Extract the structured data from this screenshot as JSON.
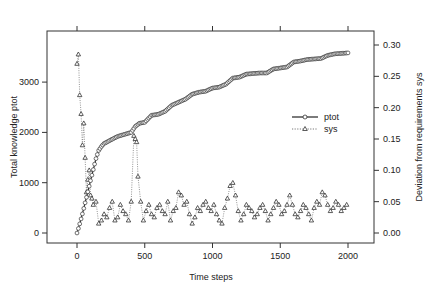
{
  "chart_data": {
    "type": "line",
    "title": "",
    "xlabel": "Time steps",
    "ylabel": "Total knowledge ptot",
    "y2label": "Deviation from requirements sys",
    "xlim": [
      -220,
      2220
    ],
    "ylim": [
      -400,
      3900
    ],
    "y2lim": [
      -0.032,
      0.33
    ],
    "x_ticks": [
      0,
      500,
      1000,
      1500,
      2000
    ],
    "y_ticks": [
      0,
      1000,
      2000,
      3000
    ],
    "y2_ticks": [
      "0.00",
      "0.05",
      "0.10",
      "0.15",
      "0.20",
      "0.25",
      "0.30"
    ],
    "grid": false,
    "legend": {
      "position": "center-right",
      "entries": [
        "ptot",
        "sys"
      ]
    },
    "series": [
      {
        "name": "ptot",
        "axis": "left",
        "style": "solid line with open circles",
        "x": [
          0,
          20,
          40,
          60,
          80,
          100,
          120,
          140,
          160,
          180,
          200,
          250,
          300,
          350,
          400,
          430,
          460,
          500,
          550,
          600,
          650,
          700,
          750,
          800,
          850,
          900,
          950,
          1000,
          1050,
          1100,
          1150,
          1200,
          1250,
          1300,
          1350,
          1400,
          1450,
          1500,
          1550,
          1600,
          1650,
          1700,
          1750,
          1800,
          1850,
          1900,
          1950,
          2000
        ],
        "values": [
          0,
          180,
          380,
          600,
          820,
          1040,
          1260,
          1480,
          1640,
          1720,
          1780,
          1850,
          1920,
          1960,
          2000,
          2120,
          2180,
          2200,
          2340,
          2360,
          2420,
          2540,
          2600,
          2660,
          2760,
          2800,
          2820,
          2880,
          2900,
          2960,
          3080,
          3100,
          3160,
          3170,
          3180,
          3180,
          3260,
          3280,
          3300,
          3400,
          3420,
          3450,
          3460,
          3470,
          3530,
          3560,
          3570,
          3580
        ]
      },
      {
        "name": "sys",
        "axis": "right",
        "style": "dotted line with open triangles",
        "x": [
          0,
          10,
          20,
          30,
          40,
          50,
          60,
          70,
          80,
          90,
          100,
          110,
          120,
          140,
          160,
          180,
          200,
          220,
          240,
          260,
          280,
          300,
          320,
          340,
          360,
          380,
          400,
          420,
          430,
          440,
          450,
          470,
          490,
          510,
          530,
          550,
          570,
          590,
          610,
          630,
          650,
          670,
          690,
          710,
          730,
          750,
          770,
          790,
          810,
          830,
          850,
          870,
          890,
          910,
          930,
          950,
          970,
          990,
          1010,
          1030,
          1050,
          1070,
          1090,
          1110,
          1130,
          1150,
          1170,
          1190,
          1210,
          1230,
          1250,
          1270,
          1290,
          1310,
          1330,
          1350,
          1370,
          1390,
          1410,
          1430,
          1450,
          1470,
          1490,
          1510,
          1530,
          1550,
          1570,
          1590,
          1610,
          1630,
          1650,
          1670,
          1690,
          1710,
          1730,
          1750,
          1770,
          1790,
          1810,
          1830,
          1850,
          1870,
          1890,
          1910,
          1930,
          1950,
          1970,
          1990
        ],
        "values": [
          0.27,
          0.285,
          0.22,
          0.19,
          0.14,
          0.175,
          0.12,
          0.065,
          0.085,
          0.1,
          0.06,
          0.055,
          0.045,
          0.05,
          0.015,
          0.02,
          0.03,
          0.025,
          0.04,
          0.05,
          0.02,
          0.025,
          0.045,
          0.035,
          0.03,
          0.02,
          0.05,
          0.155,
          0.15,
          0.145,
          0.09,
          0.05,
          0.02,
          0.035,
          0.045,
          0.03,
          0.025,
          0.04,
          0.045,
          0.035,
          0.03,
          0.05,
          0.02,
          0.035,
          0.04,
          0.065,
          0.06,
          0.045,
          0.05,
          0.03,
          0.015,
          0.025,
          0.04,
          0.035,
          0.045,
          0.05,
          0.04,
          0.035,
          0.045,
          0.03,
          0.02,
          0.015,
          0.04,
          0.055,
          0.075,
          0.08,
          0.06,
          0.035,
          0.02,
          0.03,
          0.045,
          0.04,
          0.035,
          0.025,
          0.03,
          0.04,
          0.045,
          0.035,
          0.02,
          0.03,
          0.04,
          0.05,
          0.045,
          0.03,
          0.035,
          0.045,
          0.06,
          0.045,
          0.03,
          0.025,
          0.035,
          0.045,
          0.04,
          0.03,
          0.02,
          0.04,
          0.05,
          0.045,
          0.065,
          0.06,
          0.045,
          0.035,
          0.04,
          0.05,
          0.045,
          0.035,
          0.04,
          0.045
        ]
      }
    ]
  }
}
